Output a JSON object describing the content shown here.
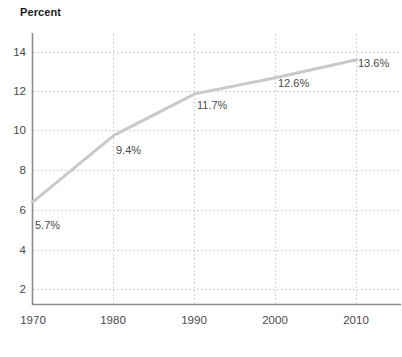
{
  "chart_data": {
    "type": "line",
    "title": "Percent",
    "xlabel": "",
    "ylabel": "",
    "x": [
      1970,
      1980,
      1990,
      2000,
      2010
    ],
    "categories": [
      "1970",
      "1980",
      "1990",
      "2000",
      "2010"
    ],
    "values": [
      5.7,
      9.4,
      11.7,
      12.6,
      13.6
    ],
    "point_labels": [
      "5.7%",
      "9.4%",
      "11.7%",
      "12.6%",
      "13.6%"
    ],
    "xlim": [
      1970,
      2010
    ],
    "ylim": [
      0,
      15
    ],
    "yticks": [
      2,
      4,
      6,
      8,
      10,
      12,
      14
    ],
    "ytick_labels": [
      "2",
      "4",
      "6",
      "8",
      "10",
      "12",
      "14"
    ],
    "xticks": [
      1970,
      1980,
      1990,
      2000,
      2010
    ],
    "xtick_labels": [
      "1970",
      "1980",
      "1990",
      "2000",
      "2010"
    ],
    "grid": "dotted-both",
    "legend": "none",
    "series": [
      {
        "name": "Percent",
        "values": [
          5.7,
          9.4,
          11.7,
          12.6,
          13.6
        ],
        "color": "#c9c9c9"
      }
    ]
  },
  "colors": {
    "line": "#c9c9c9",
    "grid": "#c4c4cc",
    "axis": "#8c8c8c",
    "text": "#4a4a4a",
    "title_text": "#1c1c1c",
    "background": "#ffffff"
  },
  "axis": {
    "y_tick_0": "2",
    "y_tick_1": "4",
    "y_tick_2": "6",
    "y_tick_3": "8",
    "y_tick_4": "10",
    "y_tick_5": "12",
    "y_tick_6": "14",
    "x_tick_0": "1970",
    "x_tick_1": "1980",
    "x_tick_2": "1990",
    "x_tick_3": "2000",
    "x_tick_4": "2010"
  },
  "labels": {
    "p0": "5.7%",
    "p1": "9.4%",
    "p2": "11.7%",
    "p3": "12.6%",
    "p4": "13.6%"
  }
}
